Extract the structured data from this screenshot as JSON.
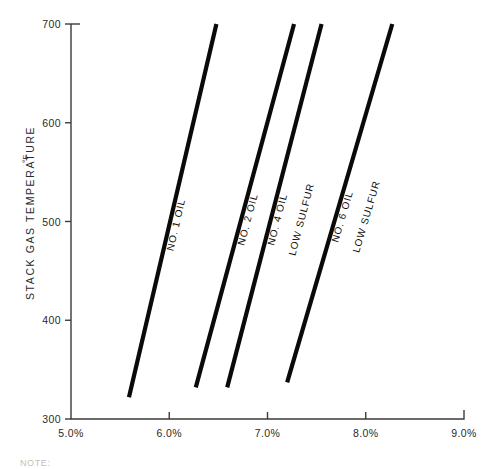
{
  "chart_data": {
    "type": "line",
    "title": "",
    "xlabel": "",
    "ylabel": "STACK GAS TEMPERATURE",
    "ylabel_superscript": "°F",
    "xlim": [
      5.0,
      9.0
    ],
    "ylim": [
      300,
      700
    ],
    "grid": false,
    "legend_position": "inline-on-lines",
    "x_tick_labels": [
      "5.0%",
      "6.0%",
      "7.0%",
      "8.0%",
      "9.0%"
    ],
    "x_tick_values": [
      5.0,
      6.0,
      7.0,
      8.0,
      9.0
    ],
    "y_tick_labels": [
      "300",
      "400",
      "500",
      "600",
      "700"
    ],
    "y_tick_values": [
      300,
      400,
      500,
      600,
      700
    ],
    "series": [
      {
        "name": "NO. 1 OIL",
        "label_lines": [
          "NO. 1 OIL"
        ],
        "x": [
          5.59,
          6.48
        ],
        "y": [
          322,
          700
        ]
      },
      {
        "name": "NO. 2 OIL",
        "label_lines": [
          "NO. 2 OIL"
        ],
        "x": [
          6.27,
          7.27
        ],
        "y": [
          332,
          700
        ]
      },
      {
        "name": "NO. 4 OIL LOW SULFUR",
        "label_lines": [
          "NO. 4 OIL",
          "LOW SULFUR"
        ],
        "x": [
          6.59,
          7.55
        ],
        "y": [
          332,
          700
        ]
      },
      {
        "name": "NO. 6 OIL LOW SULFUR",
        "label_lines": [
          "NO. 6 OIL",
          "LOW SULFUR"
        ],
        "x": [
          7.2,
          8.27
        ],
        "y": [
          337,
          700
        ]
      }
    ]
  },
  "footer": {
    "note": "NOTE:"
  },
  "colors": {
    "line": "#0a0a0a",
    "axis": "#3b3b3b",
    "background": "#ffffff"
  }
}
